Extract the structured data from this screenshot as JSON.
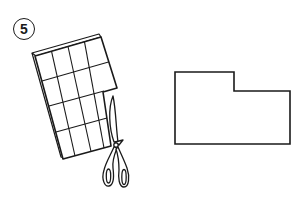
{
  "step": {
    "number": "5"
  },
  "illustration": {
    "left": {
      "description": "grid paper being cut with scissors",
      "grid_columns": 4,
      "grid_rows": 4,
      "icon": "scissors-icon"
    },
    "right": {
      "description": "L-shaped cut-out outline"
    }
  },
  "colors": {
    "stroke": "#1a1a1a",
    "background": "#ffffff"
  }
}
